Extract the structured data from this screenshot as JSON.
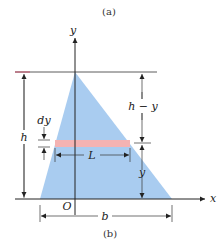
{
  "figure": {
    "caption_top": "(a)",
    "caption_bottom": "(b)"
  },
  "axes": {
    "x_label": "x",
    "y_label": "y",
    "origin_label": "O"
  },
  "dimensions": {
    "height": "h",
    "height_minus_y": "h − y",
    "y_dist": "y",
    "strip_thickness": "dy",
    "strip_length": "L",
    "base": "b"
  },
  "colors": {
    "triangle_fill": "#a9ccf0",
    "strip_fill": "#f4b3b3",
    "line": "#222222",
    "top_line_left": "#c8506a"
  }
}
